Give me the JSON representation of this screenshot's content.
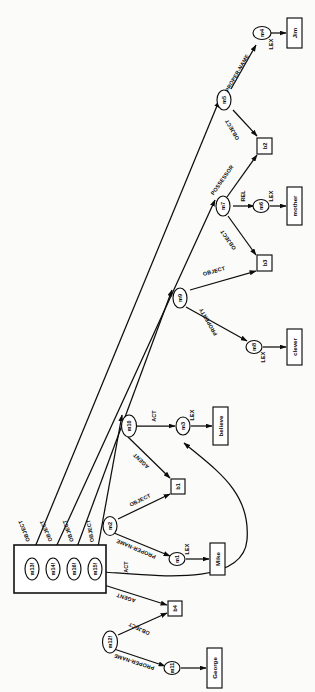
{
  "figure": {
    "title": "",
    "type": "semantic-network-diagram",
    "orientation": "rotated-90-ccw",
    "background_color": "#fbfbfa",
    "line_color": "#0d0d0d"
  },
  "nodes": [
    {
      "id": "m4",
      "label": "m4",
      "shape": "ellipse"
    },
    {
      "id": "m5",
      "label": "m5",
      "shape": "ellipse"
    },
    {
      "id": "b2",
      "label": "b2",
      "shape": "rect"
    },
    {
      "id": "m7",
      "label": "m7",
      "shape": "ellipse"
    },
    {
      "id": "m6",
      "label": "m6",
      "shape": "ellipse"
    },
    {
      "id": "b3",
      "label": "b3",
      "shape": "rect"
    },
    {
      "id": "m9",
      "label": "m9",
      "shape": "ellipse"
    },
    {
      "id": "m8",
      "label": "m8",
      "shape": "ellipse"
    },
    {
      "id": "m10",
      "label": "m10",
      "shape": "ellipse"
    },
    {
      "id": "m3",
      "label": "m3",
      "shape": "ellipse"
    },
    {
      "id": "b1",
      "label": "b1",
      "shape": "rect"
    },
    {
      "id": "m2",
      "label": "m2",
      "shape": "ellipse"
    },
    {
      "id": "m1",
      "label": "m1",
      "shape": "ellipse"
    },
    {
      "id": "m13",
      "label": "m13!",
      "shape": "ellipse"
    },
    {
      "id": "m14",
      "label": "m14!",
      "shape": "ellipse"
    },
    {
      "id": "m16",
      "label": "m16!",
      "shape": "ellipse"
    },
    {
      "id": "m15",
      "label": "m15!",
      "shape": "ellipse"
    },
    {
      "id": "b4",
      "label": "b4",
      "shape": "rect"
    },
    {
      "id": "m12",
      "label": "m12!",
      "shape": "ellipse"
    },
    {
      "id": "m11",
      "label": "m11",
      "shape": "ellipse"
    }
  ],
  "lexemes": [
    {
      "id": "lex-jim",
      "label": "Jim"
    },
    {
      "id": "lex-mother",
      "label": "mother"
    },
    {
      "id": "lex-clever",
      "label": "clever"
    },
    {
      "id": "lex-believe",
      "label": "believe"
    },
    {
      "id": "lex-mike",
      "label": "Mike"
    },
    {
      "id": "lex-george",
      "label": "George"
    }
  ],
  "edges": [
    {
      "from": "m5",
      "to": "m4",
      "label": "PROPER-NAME"
    },
    {
      "from": "m4",
      "to": "lex-jim",
      "label": "LEX"
    },
    {
      "from": "m5",
      "to": "b2",
      "label": "OBJECT"
    },
    {
      "from": "m7",
      "to": "b2",
      "label": "POSSESSOR"
    },
    {
      "from": "m7",
      "to": "m6",
      "label": "REL"
    },
    {
      "from": "m6",
      "to": "lex-mother",
      "label": "LEX"
    },
    {
      "from": "m7",
      "to": "b3",
      "label": "OBJECT"
    },
    {
      "from": "m9",
      "to": "b3",
      "label": "OBJECT"
    },
    {
      "from": "m9",
      "to": "m8",
      "label": "PROPERTY"
    },
    {
      "from": "m8",
      "to": "lex-clever",
      "label": "LEX"
    },
    {
      "from": "m10",
      "to": "m3",
      "label": "ACT"
    },
    {
      "from": "m3",
      "to": "lex-believe",
      "label": "LEX"
    },
    {
      "from": "m10",
      "to": "b1",
      "label": "AGENT"
    },
    {
      "from": "m2",
      "to": "b1",
      "label": "OBJECT"
    },
    {
      "from": "m2",
      "to": "m1",
      "label": "PROPER-NAME"
    },
    {
      "from": "m1",
      "to": "lex-mike",
      "label": "LEX"
    },
    {
      "from": "m13",
      "to": "m5",
      "label": "OBJECT"
    },
    {
      "from": "m14",
      "to": "m7",
      "label": "OBJECT"
    },
    {
      "from": "m16",
      "to": "m9",
      "label": "OBJECT"
    },
    {
      "from": "m15",
      "to": "m10",
      "label": "OBJECT"
    },
    {
      "from": "m15",
      "to": "m3",
      "label": "ACT"
    },
    {
      "from": "m15",
      "to": "b4",
      "label": "AGENT"
    },
    {
      "from": "m12",
      "to": "b4",
      "label": "OBJECT"
    },
    {
      "from": "m12",
      "to": "m11",
      "label": "PROPER-NAME"
    },
    {
      "from": "m11",
      "to": "lex-george",
      "label": "LEX"
    }
  ],
  "arc_labels": {
    "proper_name": "PROPER-NAME",
    "lex": "LEX",
    "object": "OBJECT",
    "possessor": "POSSESSOR",
    "rel": "REL",
    "property": "PROPERTY",
    "act": "ACT",
    "agent": "AGENT"
  },
  "base_box": {
    "name": "asserted-proposition-group",
    "members": [
      "m13!",
      "m14!",
      "m16!",
      "m15!"
    ]
  }
}
